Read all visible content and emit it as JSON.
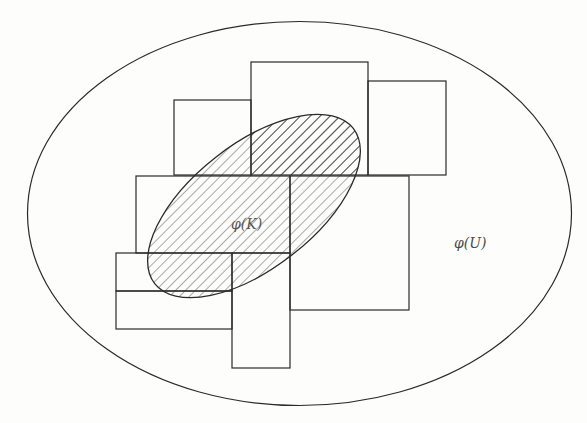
{
  "diagram": {
    "type": "set-cover-illustration",
    "labels": {
      "inner_set": "φ(K)",
      "outer_set": "φ(U)"
    },
    "colors": {
      "stroke": "#2a2a2a",
      "hatch": "#555555",
      "background": "#fdfdfb"
    },
    "outer_ellipse": {
      "cx": 299.5,
      "cy": 213.5,
      "rx": 272,
      "ry": 192
    },
    "inner_ellipse": {
      "cx": 254,
      "cy": 206,
      "rx": 126,
      "ry": 62,
      "rotation_deg": -38,
      "fill": "hatched"
    },
    "rectangles": [
      {
        "id": "rect-top-center",
        "x": 251,
        "y": 62,
        "w": 117,
        "h": 113
      },
      {
        "id": "rect-top-left",
        "x": 174,
        "y": 100,
        "w": 77,
        "h": 75
      },
      {
        "id": "rect-top-right",
        "x": 368,
        "y": 81,
        "w": 78,
        "h": 94
      },
      {
        "id": "rect-middle-left",
        "x": 136,
        "y": 176,
        "w": 154,
        "h": 77
      },
      {
        "id": "rect-middle-right",
        "x": 290,
        "y": 176,
        "w": 119,
        "h": 134
      },
      {
        "id": "rect-bottom-left-upper",
        "x": 116,
        "y": 253,
        "w": 116,
        "h": 38
      },
      {
        "id": "rect-bottom-left-lower",
        "x": 116,
        "y": 291,
        "w": 116,
        "h": 38
      },
      {
        "id": "rect-bottom-narrow",
        "x": 232,
        "y": 253,
        "w": 58,
        "h": 115
      }
    ]
  }
}
